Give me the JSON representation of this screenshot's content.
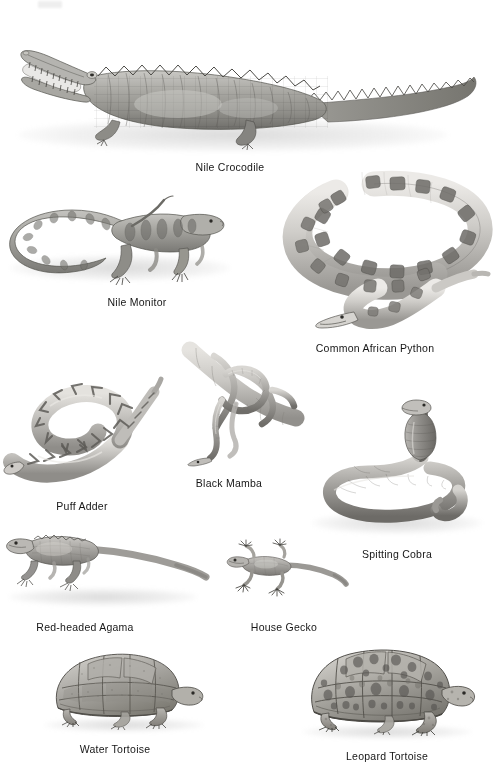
{
  "plate": {
    "title": "African Reptiles",
    "background_color": "#ffffff",
    "ink_color": "#161616",
    "width": 495,
    "height": 779,
    "artifact_label": "scan-smudge"
  },
  "figures": [
    {
      "id": "nile-crocodile",
      "label": "Nile Crocodile",
      "icon": "crocodile-illustration",
      "caption_x": 230,
      "caption_y": 161,
      "row": 1,
      "description": "Large crocodile in side profile with jaws agape showing teeth, heavily scaled armored back and long tail."
    },
    {
      "id": "nile-monitor",
      "label": "Nile Monitor",
      "icon": "monitor-lizard-illustration",
      "caption_x": 137,
      "caption_y": 296,
      "row": 2,
      "description": "Banded monitor lizard walking to the right with long curling tail."
    },
    {
      "id": "common-african-python",
      "label": "Common African Python",
      "icon": "python-illustration",
      "caption_x": 375,
      "caption_y": 342,
      "row": 2,
      "description": "Large blotched python coiled in loose loops with head at lower centre."
    },
    {
      "id": "puff-adder",
      "label": "Puff Adder",
      "icon": "puff-adder-illustration",
      "caption_x": 82,
      "caption_y": 500,
      "row": 3,
      "description": "Thick-bodied chevron-patterned viper coiled in an S with tail raised."
    },
    {
      "id": "black-mamba",
      "label": "Black Mamba",
      "icon": "black-mamba-illustration",
      "caption_x": 229,
      "caption_y": 477,
      "row": 3,
      "description": "Slender snake draped and looping around a tree branch, head hanging down."
    },
    {
      "id": "spitting-cobra",
      "label": "Spitting Cobra",
      "icon": "spitting-cobra-illustration",
      "caption_x": 397,
      "caption_y": 548,
      "row": 3,
      "description": "Cobra reared up with hood spread, body coiled in a loop on the ground."
    },
    {
      "id": "red-headed-agama",
      "label": "Red-headed Agama",
      "icon": "agama-lizard-illustration",
      "caption_x": 85,
      "caption_y": 621,
      "row": 4,
      "description": "Agama lizard in profile facing left with long tapering tail."
    },
    {
      "id": "house-gecko",
      "label": "House Gecko",
      "icon": "gecko-illustration",
      "caption_x": 284,
      "caption_y": 621,
      "row": 4,
      "description": "Small gecko with splayed toes viewed from above, facing left."
    },
    {
      "id": "water-tortoise",
      "label": "Water Tortoise",
      "icon": "water-tortoise-illustration",
      "caption_x": 115,
      "caption_y": 743,
      "row": 5,
      "description": "Domed tortoise in side profile facing right with plain blocky scutes."
    },
    {
      "id": "leopard-tortoise",
      "label": "Leopard Tortoise",
      "icon": "leopard-tortoise-illustration",
      "caption_x": 387,
      "caption_y": 750,
      "row": 5,
      "description": "High-domed tortoise facing right with heavily mottled leopard-spotted scutes."
    }
  ]
}
